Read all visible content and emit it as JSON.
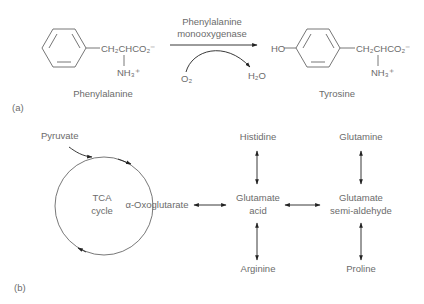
{
  "figure": {
    "panel_a": {
      "label": "(a)",
      "substrate": {
        "name": "Phenylalanine",
        "side_chain": "CH₂CHCO₂⁻",
        "amine": "NH₃⁺"
      },
      "enzyme": {
        "line1": "Phenylalanine",
        "line2": "monooxygenase"
      },
      "cosubstrate_in": "O₂",
      "coproduct_out": "H₂O",
      "product": {
        "name": "Tyrosine",
        "hydroxyl": "HO",
        "side_chain": "CH₂CHCO₂⁻",
        "amine": "NH₃⁺"
      }
    },
    "panel_b": {
      "label": "(b)",
      "input": "Pyruvate",
      "cycle": {
        "line1": "TCA",
        "line2": "cycle"
      },
      "cycle_intermediate": "α-Oxoglutarate",
      "hub": {
        "line1": "Glutamate",
        "line2": "acid"
      },
      "hub2": {
        "line1": "Glutamate",
        "line2": "semi-aldehyde"
      },
      "hub_top": "Histidine",
      "hub_bottom": "Arginine",
      "hub2_top": "Glutamine",
      "hub2_bottom": "Proline"
    },
    "colors": {
      "text": "#6b6b6b",
      "arrow": "#222222",
      "background": "#ffffff"
    }
  }
}
